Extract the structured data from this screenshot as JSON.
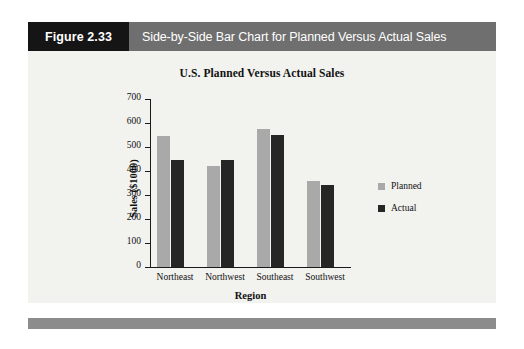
{
  "figure": {
    "number": "Figure 2.33",
    "caption": "Side-by-Side Bar Chart for Planned Versus Actual Sales"
  },
  "colors": {
    "figure_number_bg": "#151515",
    "caption_bg": "#6f6f6f",
    "panel_bg": "#f2f2ef",
    "footer_bar": "#8c8c8c",
    "planned": "#a9a9a9",
    "actual": "#262626"
  },
  "chart_data": {
    "type": "bar",
    "title": "U.S. Planned Versus Actual Sales",
    "xlabel": "Region",
    "ylabel": "Sales ($1000)",
    "categories": [
      "Northeast",
      "Northwest",
      "Southeast",
      "Southwest"
    ],
    "series": [
      {
        "name": "Planned",
        "color": "#a9a9a9",
        "values": [
          545,
          420,
          575,
          360
        ]
      },
      {
        "name": "Actual",
        "color": "#262626",
        "values": [
          445,
          445,
          550,
          340
        ]
      }
    ],
    "ylim": [
      0,
      700
    ],
    "yticks": [
      0,
      100,
      200,
      300,
      400,
      500,
      600,
      700
    ],
    "ytick_labels": [
      "0",
      "100",
      "200",
      "300",
      "400",
      "500",
      "600",
      "700"
    ],
    "grid": false,
    "legend_position": "right"
  }
}
